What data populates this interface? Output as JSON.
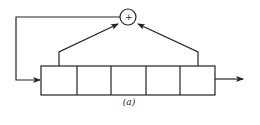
{
  "diagram": {
    "caption": "(a)",
    "adder_symbol": "+",
    "register_cells": 5,
    "taps": [
      1,
      5
    ],
    "stroke_color": "#222222"
  }
}
